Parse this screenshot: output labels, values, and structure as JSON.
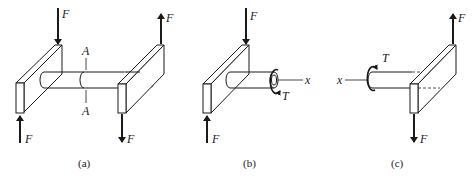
{
  "figure": {
    "panels": [
      {
        "id": "a",
        "caption": "(a)",
        "labels": {
          "force_top_left": "F",
          "force_bottom_left": "F",
          "force_top_right": "F",
          "force_bottom_right": "F",
          "section_top": "A",
          "section_bottom": "A"
        }
      },
      {
        "id": "b",
        "caption": "(b)",
        "labels": {
          "force_top": "F",
          "force_bottom": "F",
          "torque": "T",
          "axis": "x"
        }
      },
      {
        "id": "c",
        "caption": "(c)",
        "labels": {
          "force_top": "F",
          "force_bottom": "F",
          "torque": "T",
          "axis": "x"
        }
      }
    ],
    "colors": {
      "ink": "#1a1a1a",
      "background": "#ffffff"
    }
  }
}
